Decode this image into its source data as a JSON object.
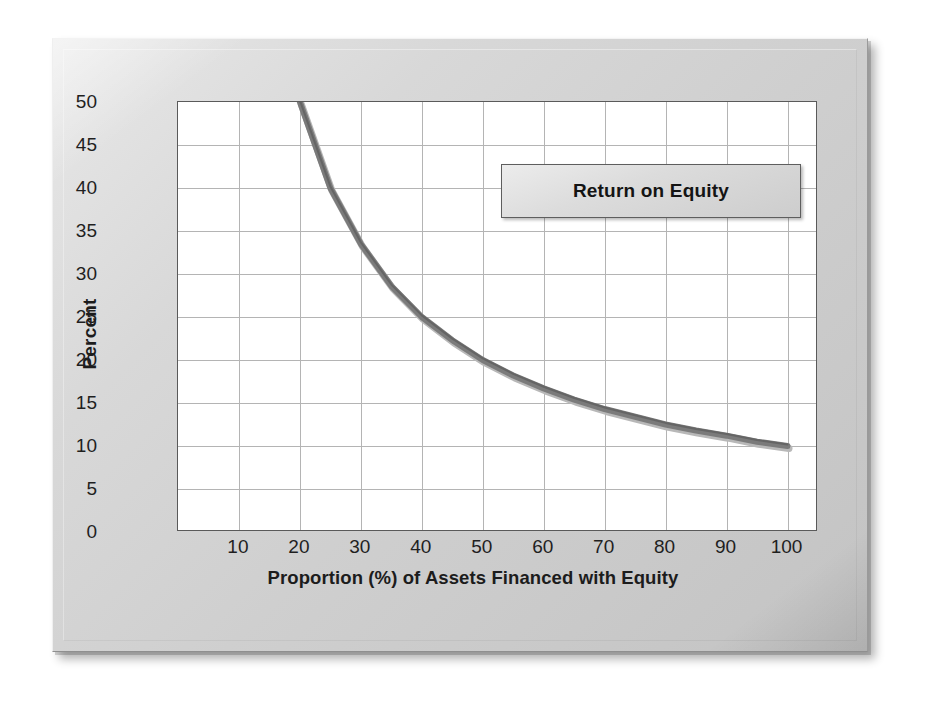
{
  "chart_data": {
    "type": "line",
    "title": "",
    "xlabel": "Proportion (%) of Assets Financed with Equity",
    "ylabel": "Percent",
    "xlim": [
      0,
      105
    ],
    "ylim": [
      0,
      50
    ],
    "grid": true,
    "legend_position": "inside-top-right",
    "x_ticks": [
      "10",
      "20",
      "30",
      "40",
      "50",
      "60",
      "70",
      "80",
      "90",
      "100"
    ],
    "x_tick_values": [
      10,
      20,
      30,
      40,
      50,
      60,
      70,
      80,
      90,
      100
    ],
    "y_ticks": [
      "0",
      "5",
      "10",
      "15",
      "20",
      "25",
      "30",
      "35",
      "40",
      "45",
      "50"
    ],
    "y_tick_values": [
      0,
      5,
      10,
      15,
      20,
      25,
      30,
      35,
      40,
      45,
      50
    ],
    "series": [
      {
        "name": "Return on Equity",
        "color": "#7b7b7b",
        "x": [
          20,
          25,
          30,
          35,
          40,
          45,
          50,
          55,
          60,
          65,
          70,
          75,
          80,
          85,
          90,
          95,
          100
        ],
        "values": [
          50.0,
          40.0,
          33.5,
          28.6,
          25.0,
          22.3,
          20.0,
          18.2,
          16.7,
          15.4,
          14.3,
          13.4,
          12.5,
          11.8,
          11.2,
          10.5,
          10.0
        ]
      }
    ]
  },
  "legend": {
    "label": "Return on Equity"
  },
  "axes": {
    "y_title": "Percent",
    "x_title": "Proportion (%) of Assets Financed with Equity"
  }
}
